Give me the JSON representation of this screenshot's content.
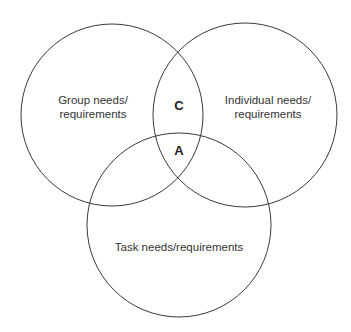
{
  "diagram": {
    "type": "venn",
    "circles": [
      {
        "name": "group",
        "label_lines": [
          "Group needs/",
          "requirements"
        ]
      },
      {
        "name": "individual",
        "label_lines": [
          "Individual needs/",
          "requirements"
        ]
      },
      {
        "name": "task",
        "label_lines": [
          "Task needs/requirements"
        ]
      }
    ],
    "intersections": {
      "group_individual": "C",
      "all_three": "A"
    },
    "colors": {
      "stroke": "#3a3a3a",
      "text": "#333333",
      "background": "#ffffff"
    }
  }
}
